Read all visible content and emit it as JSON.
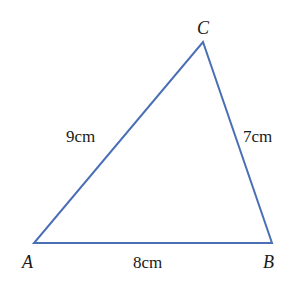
{
  "diagram": {
    "type": "triangle",
    "stroke_color": "#4a6fb5",
    "vertices": {
      "A": {
        "label": "A",
        "x": 34,
        "y": 243
      },
      "B": {
        "label": "B",
        "x": 272,
        "y": 243
      },
      "C": {
        "label": "C",
        "x": 203,
        "y": 42
      }
    },
    "sides": {
      "AC": {
        "label": "9cm",
        "length": 9,
        "unit": "cm"
      },
      "BC": {
        "label": "7cm",
        "length": 7,
        "unit": "cm"
      },
      "AB": {
        "label": "8cm",
        "length": 8,
        "unit": "cm"
      }
    }
  }
}
